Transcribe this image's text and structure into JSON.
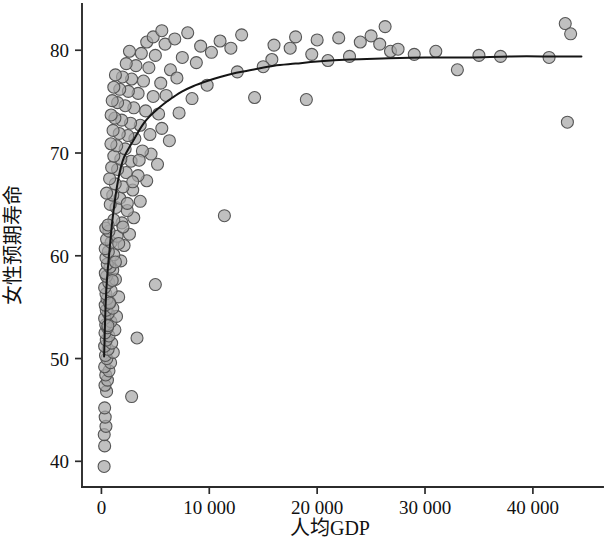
{
  "chart_data": {
    "type": "scatter",
    "title": "",
    "subtitle": "",
    "xlabel": "人均GDP",
    "ylabel": "女性预期寿命",
    "xlim": [
      -1800,
      46500
    ],
    "ylim": [
      37.5,
      84.5
    ],
    "xticks": [
      0,
      10000,
      20000,
      30000,
      40000
    ],
    "xtick_labels": [
      "0",
      "10 000",
      "20 000",
      "30 000",
      "40 000"
    ],
    "yticks": [
      40,
      50,
      60,
      70,
      80
    ],
    "ytick_labels": [
      "40",
      "50",
      "60",
      "70",
      "80"
    ],
    "grid": false,
    "legend": null,
    "marker": {
      "shape": "circle",
      "radius_px": 6,
      "fill_color": "#a8a8a8",
      "edge_color": "#555555",
      "opacity": 0.72
    },
    "series": [
      {
        "name": "国家",
        "type": "scatter",
        "points": [
          [
            250,
            39.5
          ],
          [
            300,
            41.5
          ],
          [
            260,
            42.6
          ],
          [
            420,
            43.4
          ],
          [
            350,
            44.3
          ],
          [
            300,
            45.2
          ],
          [
            2800,
            46.3
          ],
          [
            480,
            46.8
          ],
          [
            330,
            47.4
          ],
          [
            560,
            47.9
          ],
          [
            400,
            48.4
          ],
          [
            700,
            48.8
          ],
          [
            300,
            49.2
          ],
          [
            850,
            49.6
          ],
          [
            500,
            50.0
          ],
          [
            380,
            50.3
          ],
          [
            1100,
            50.6
          ],
          [
            620,
            50.9
          ],
          [
            300,
            51.2
          ],
          [
            950,
            51.5
          ],
          [
            450,
            51.8
          ],
          [
            3300,
            52.0
          ],
          [
            700,
            52.2
          ],
          [
            330,
            52.5
          ],
          [
            1250,
            52.8
          ],
          [
            560,
            53.0
          ],
          [
            400,
            53.3
          ],
          [
            880,
            53.6
          ],
          [
            300,
            53.9
          ],
          [
            1400,
            54.1
          ],
          [
            640,
            54.4
          ],
          [
            450,
            54.7
          ],
          [
            1050,
            54.9
          ],
          [
            350,
            55.2
          ],
          [
            760,
            55.5
          ],
          [
            520,
            55.8
          ],
          [
            1600,
            56.0
          ],
          [
            420,
            56.3
          ],
          [
            900,
            56.6
          ],
          [
            300,
            56.9
          ],
          [
            5000,
            57.2
          ],
          [
            680,
            57.4
          ],
          [
            1300,
            57.7
          ],
          [
            470,
            58.0
          ],
          [
            360,
            58.3
          ],
          [
            1050,
            58.6
          ],
          [
            800,
            58.9
          ],
          [
            540,
            59.2
          ],
          [
            1800,
            59.5
          ],
          [
            420,
            59.8
          ],
          [
            1150,
            60.1
          ],
          [
            640,
            60.4
          ],
          [
            350,
            60.7
          ],
          [
            2100,
            61.0
          ],
          [
            900,
            61.3
          ],
          [
            480,
            61.6
          ],
          [
            1450,
            61.9
          ],
          [
            2600,
            62.1
          ],
          [
            700,
            62.4
          ],
          [
            400,
            62.7
          ],
          [
            11400,
            63.9
          ],
          [
            1900,
            63.2
          ],
          [
            1150,
            63.5
          ],
          [
            3000,
            63.7
          ],
          [
            620,
            63.0
          ],
          [
            2400,
            64.4
          ],
          [
            1350,
            64.7
          ],
          [
            820,
            65.0
          ],
          [
            3600,
            65.3
          ],
          [
            1700,
            65.6
          ],
          [
            1050,
            65.9
          ],
          [
            480,
            66.1
          ],
          [
            2900,
            66.4
          ],
          [
            2000,
            66.7
          ],
          [
            1280,
            67.0
          ],
          [
            4200,
            67.3
          ],
          [
            760,
            67.5
          ],
          [
            3400,
            67.8
          ],
          [
            2300,
            68.1
          ],
          [
            1500,
            68.4
          ],
          [
            950,
            68.6
          ],
          [
            5200,
            68.9
          ],
          [
            2750,
            69.2
          ],
          [
            1800,
            69.4
          ],
          [
            1150,
            69.7
          ],
          [
            4600,
            69.9
          ],
          [
            3800,
            70.2
          ],
          [
            2200,
            70.4
          ],
          [
            1420,
            70.7
          ],
          [
            880,
            70.9
          ],
          [
            6300,
            71.2
          ],
          [
            3100,
            71.4
          ],
          [
            2450,
            71.7
          ],
          [
            1650,
            71.9
          ],
          [
            1080,
            72.2
          ],
          [
            5600,
            72.4
          ],
          [
            3600,
            72.7
          ],
          [
            2700,
            72.9
          ],
          [
            1880,
            73.2
          ],
          [
            1250,
            73.4
          ],
          [
            900,
            73.7
          ],
          [
            7200,
            73.9
          ],
          [
            4100,
            74.1
          ],
          [
            3000,
            74.4
          ],
          [
            2200,
            74.6
          ],
          [
            1500,
            74.9
          ],
          [
            1000,
            75.1
          ],
          [
            8400,
            75.3
          ],
          [
            4800,
            75.5
          ],
          [
            3400,
            75.8
          ],
          [
            2500,
            76.0
          ],
          [
            1700,
            76.2
          ],
          [
            1150,
            76.4
          ],
          [
            9800,
            76.6
          ],
          [
            5500,
            76.8
          ],
          [
            3900,
            77.0
          ],
          [
            2800,
            77.2
          ],
          [
            1950,
            77.4
          ],
          [
            1300,
            77.6
          ],
          [
            12600,
            77.9
          ],
          [
            6400,
            78.1
          ],
          [
            4400,
            78.3
          ],
          [
            3200,
            78.5
          ],
          [
            2300,
            78.7
          ],
          [
            14200,
            75.4
          ],
          [
            15800,
            79.1
          ],
          [
            7500,
            79.3
          ],
          [
            5000,
            79.5
          ],
          [
            3700,
            79.7
          ],
          [
            2600,
            79.9
          ],
          [
            17500,
            80.2
          ],
          [
            9200,
            80.4
          ],
          [
            5900,
            80.6
          ],
          [
            4200,
            80.8
          ],
          [
            19000,
            75.2
          ],
          [
            19500,
            79.6
          ],
          [
            11000,
            80.9
          ],
          [
            6800,
            81.1
          ],
          [
            4800,
            81.3
          ],
          [
            21000,
            79.0
          ],
          [
            23000,
            79.4
          ],
          [
            13000,
            81.5
          ],
          [
            8000,
            81.7
          ],
          [
            5600,
            81.9
          ],
          [
            25000,
            81.4
          ],
          [
            26300,
            82.3
          ],
          [
            26800,
            79.9
          ],
          [
            27500,
            80.1
          ],
          [
            16000,
            80.5
          ],
          [
            15000,
            78.4
          ],
          [
            29000,
            79.6
          ],
          [
            31000,
            79.9
          ],
          [
            33000,
            78.1
          ],
          [
            35000,
            79.5
          ],
          [
            25800,
            80.6
          ],
          [
            41500,
            79.3
          ],
          [
            43000,
            82.6
          ],
          [
            43500,
            81.6
          ],
          [
            43200,
            73.0
          ],
          [
            37000,
            79.4
          ],
          [
            22000,
            81.2
          ],
          [
            24000,
            80.8
          ],
          [
            20000,
            81.0
          ],
          [
            18000,
            81.3
          ],
          [
            12000,
            80.2
          ],
          [
            10200,
            79.8
          ],
          [
            8800,
            78.8
          ],
          [
            7000,
            77.3
          ],
          [
            6000,
            75.6
          ],
          [
            5300,
            73.8
          ],
          [
            4500,
            71.8
          ],
          [
            3500,
            69.3
          ],
          [
            2900,
            67.2
          ],
          [
            2400,
            65.1
          ],
          [
            2000,
            62.8
          ],
          [
            1600,
            61.2
          ],
          [
            1300,
            59.4
          ],
          [
            1000,
            57.6
          ],
          [
            760,
            55.4
          ],
          [
            600,
            53.2
          ]
        ]
      }
    ],
    "fit_curve": {
      "name": "LOESS 平滑曲线",
      "color": "#151515",
      "points": [
        [
          250,
          50.2
        ],
        [
          350,
          54.0
        ],
        [
          450,
          56.6
        ],
        [
          600,
          58.8
        ],
        [
          800,
          61.1
        ],
        [
          1000,
          63.3
        ],
        [
          1250,
          65.4
        ],
        [
          1500,
          67.1
        ],
        [
          1800,
          68.6
        ],
        [
          2100,
          69.6
        ],
        [
          2500,
          70.4
        ],
        [
          3000,
          71.3
        ],
        [
          3500,
          72.2
        ],
        [
          4000,
          73.0
        ],
        [
          4500,
          73.6
        ],
        [
          5000,
          74.1
        ],
        [
          5800,
          74.8
        ],
        [
          6600,
          75.4
        ],
        [
          7500,
          76.0
        ],
        [
          8500,
          76.5
        ],
        [
          9800,
          77.0
        ],
        [
          11000,
          77.4
        ],
        [
          12500,
          77.8
        ],
        [
          14000,
          78.1
        ],
        [
          16000,
          78.5
        ],
        [
          18000,
          78.7
        ],
        [
          20000,
          78.9
        ],
        [
          23000,
          79.1
        ],
        [
          26000,
          79.2
        ],
        [
          30000,
          79.3
        ],
        [
          34000,
          79.3
        ],
        [
          38000,
          79.4
        ],
        [
          42000,
          79.4
        ],
        [
          44500,
          79.4
        ]
      ]
    }
  }
}
